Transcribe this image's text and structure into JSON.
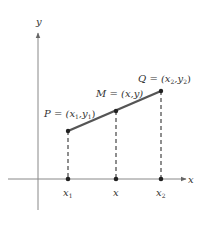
{
  "diagram": {
    "title": "",
    "axes": {
      "x_label": "x",
      "y_label": "y"
    },
    "points": [
      {
        "id": "P",
        "label": "P = (x1,y1)",
        "name": "P",
        "coord": "(x",
        "sub1": "1",
        "sep": ",y",
        "sub2": "1",
        "close": ")",
        "x": 68,
        "y": 131
      },
      {
        "id": "M",
        "label": "M = (x,y)",
        "name": "M",
        "coord": "(x,y)",
        "x": 116,
        "y": 111
      },
      {
        "id": "Q",
        "label": "Q = (x2,y2)",
        "name": "Q",
        "coord": "(x",
        "sub1": "2",
        "sep": ",y",
        "sub2": "2",
        "close": ")",
        "x": 161,
        "y": 91
      }
    ],
    "x_ticks": [
      {
        "label": "x",
        "sub": "1",
        "x": 68
      },
      {
        "label": "x",
        "sub": "",
        "x": 116
      },
      {
        "label": "x",
        "sub": "2",
        "x": 161
      }
    ],
    "colors": {
      "axis": "#777777",
      "segment": "#555555",
      "dashed": "#444444",
      "point": "#222222",
      "text": "#333333"
    }
  }
}
